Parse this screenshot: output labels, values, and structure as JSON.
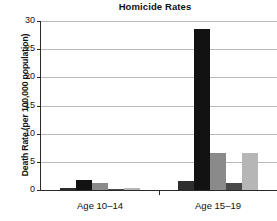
{
  "chart_data": {
    "type": "bar",
    "title": "Homicide Rates",
    "xlabel": "",
    "ylabel": "Death Rate (per 100,000 population)",
    "categories": [
      "Age 10–14",
      "Age 15–19"
    ],
    "ylim": [
      0,
      30
    ],
    "yticks": [
      0,
      5,
      10,
      15,
      20,
      25,
      30
    ],
    "ytick_labels": [
      "0",
      "5",
      "10",
      "15",
      "20",
      "25",
      "30"
    ],
    "grid": true,
    "legend": "none",
    "series": [
      {
        "name": "series-1",
        "color": "#2e2e2e",
        "values": [
          0.4,
          1.6
        ]
      },
      {
        "name": "series-2",
        "color": "#121212",
        "values": [
          1.8,
          28.5
        ]
      },
      {
        "name": "series-3",
        "color": "#8a8a8a",
        "values": [
          1.2,
          6.5
        ]
      },
      {
        "name": "series-4",
        "color": "#494949",
        "values": [
          0.2,
          1.3
        ]
      },
      {
        "name": "series-5",
        "color": "#b6b6b6",
        "values": [
          0.4,
          6.6
        ]
      }
    ]
  },
  "colors": {
    "axis": "#2a2a2a",
    "grid": "#b9b9b9",
    "text": "#111111",
    "background": "#ffffff"
  }
}
